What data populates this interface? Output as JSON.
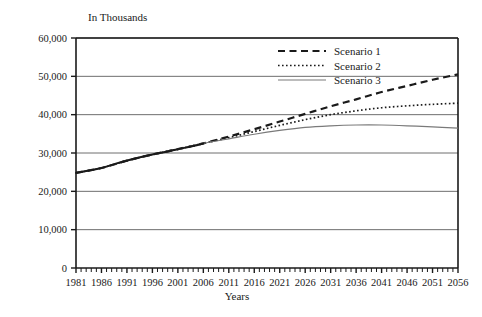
{
  "chart_data": {
    "type": "line",
    "title": "",
    "unit_label": "In Thousands",
    "xlabel": "Years",
    "ylabel": "",
    "xlim": [
      1981,
      2056
    ],
    "ylim": [
      0,
      60000
    ],
    "grid": true,
    "legend_position": "top-center-right",
    "yticks": [
      0,
      10000,
      20000,
      30000,
      40000,
      50000,
      60000
    ],
    "ytick_labels": [
      "0",
      "10,000",
      "20,000",
      "30,000",
      "40,000",
      "50,000",
      "60,000"
    ],
    "xticks": [
      1981,
      1986,
      1991,
      1996,
      2001,
      2006,
      2011,
      2016,
      2021,
      2026,
      2031,
      2036,
      2041,
      2046,
      2051,
      2056
    ],
    "xtick_labels": [
      "1981",
      "1986",
      "1991",
      "1996",
      "2001",
      "2006",
      "2011",
      "2016",
      "2021",
      "2026",
      "2031",
      "2036",
      "2041",
      "2046",
      "2051",
      "2056"
    ],
    "x_minor_tick_interval": 1,
    "x": [
      1981,
      1986,
      1991,
      1996,
      2001,
      2006,
      2011,
      2016,
      2021,
      2026,
      2031,
      2036,
      2041,
      2046,
      2051,
      2056
    ],
    "series": [
      {
        "name": "Scenario 1",
        "style": "dashed",
        "color": "#1a1a1a",
        "values": [
          24800,
          26100,
          28000,
          29600,
          31000,
          32500,
          34300,
          36200,
          38200,
          40200,
          42200,
          44000,
          45900,
          47500,
          49100,
          50500
        ]
      },
      {
        "name": "Scenario 2",
        "style": "dotted",
        "color": "#1a1a1a",
        "values": [
          24800,
          26100,
          28000,
          29600,
          31000,
          32500,
          34000,
          35600,
          37200,
          38700,
          40000,
          41000,
          41800,
          42300,
          42700,
          43000
        ]
      },
      {
        "name": "Scenario 3",
        "style": "solid",
        "color": "#7a7a7a",
        "values": [
          24800,
          26100,
          28000,
          29600,
          31000,
          32500,
          33700,
          34900,
          35900,
          36700,
          37100,
          37300,
          37300,
          37100,
          36800,
          36500
        ]
      }
    ],
    "historical_series": {
      "name": "historical",
      "style": "solid-thick",
      "color": "#1a1a1a",
      "x": [
        1981,
        1983,
        1986,
        1989,
        1991,
        1993,
        1996,
        1999,
        2001,
        2004,
        2006
      ],
      "values": [
        24800,
        25300,
        26100,
        27300,
        28000,
        28700,
        29600,
        30400,
        31000,
        31800,
        32500
      ]
    }
  },
  "legend": {
    "items": [
      {
        "label": "Scenario 1"
      },
      {
        "label": "Scenario 2"
      },
      {
        "label": "Scenario 3"
      }
    ]
  }
}
